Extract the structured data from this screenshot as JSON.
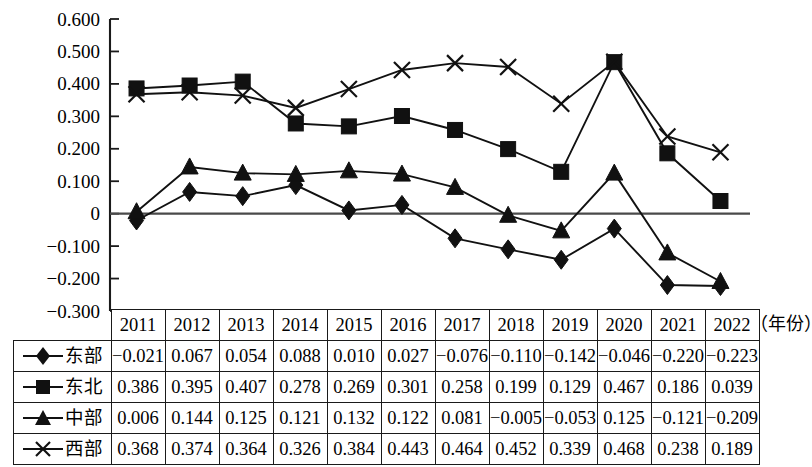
{
  "chart_data": {
    "type": "line",
    "title": "",
    "xlabel": "（年份）",
    "ylabel": "",
    "categories": [
      "2011",
      "2012",
      "2013",
      "2014",
      "2015",
      "2016",
      "2017",
      "2018",
      "2019",
      "2020",
      "2021",
      "2022"
    ],
    "ylim": [
      -0.3,
      0.6
    ],
    "ytick_labels": [
      "0.600",
      "0.500",
      "0.400",
      "0.300",
      "0.200",
      "0.100",
      "0",
      "−0.100",
      "−0.200",
      "−0.300"
    ],
    "ytick_values": [
      0.6,
      0.5,
      0.4,
      0.3,
      0.2,
      0.1,
      0,
      -0.1,
      -0.2,
      -0.3
    ],
    "grid": false,
    "legend_position": "table-row-headers",
    "zero_line": true,
    "series": [
      {
        "name": "东部",
        "marker": "diamond",
        "values": [
          -0.021,
          0.067,
          0.054,
          0.088,
          0.01,
          0.027,
          -0.076,
          -0.11,
          -0.142,
          -0.046,
          -0.22,
          -0.223
        ],
        "labels": [
          "−0.021",
          "0.067",
          "0.054",
          "0.088",
          "0.010",
          "0.027",
          "−0.076",
          "−0.110",
          "−0.142",
          "−0.046",
          "−0.220",
          "−0.223"
        ]
      },
      {
        "name": "东北",
        "marker": "square",
        "values": [
          0.386,
          0.395,
          0.407,
          0.278,
          0.269,
          0.301,
          0.258,
          0.199,
          0.129,
          0.467,
          0.186,
          0.039
        ],
        "labels": [
          "0.386",
          "0.395",
          "0.407",
          "0.278",
          "0.269",
          "0.301",
          "0.258",
          "0.199",
          "0.129",
          "0.467",
          "0.186",
          "0.039"
        ]
      },
      {
        "name": "中部",
        "marker": "triangle",
        "values": [
          0.006,
          0.144,
          0.125,
          0.121,
          0.132,
          0.122,
          0.081,
          -0.005,
          -0.053,
          0.125,
          -0.121,
          -0.209
        ],
        "labels": [
          "0.006",
          "0.144",
          "0.125",
          "0.121",
          "0.132",
          "0.122",
          "0.081",
          "−0.005",
          "−0.053",
          "0.125",
          "−0.121",
          "−0.209"
        ]
      },
      {
        "name": "西部",
        "marker": "cross",
        "values": [
          0.368,
          0.374,
          0.364,
          0.326,
          0.384,
          0.443,
          0.464,
          0.452,
          0.339,
          0.468,
          0.238,
          0.189
        ],
        "labels": [
          "0.368",
          "0.374",
          "0.364",
          "0.326",
          "0.384",
          "0.443",
          "0.464",
          "0.452",
          "0.339",
          "0.468",
          "0.238",
          "0.189"
        ]
      }
    ],
    "colors": {
      "line": "#111111",
      "axis": "#1a1a1a",
      "zero_line": "#4a4a4a",
      "background": "#ffffff"
    }
  },
  "table": {
    "corner": "",
    "year_header": [
      "2011",
      "2012",
      "2013",
      "2014",
      "2015",
      "2016",
      "2017",
      "2018",
      "2019",
      "2020",
      "2021",
      "2022"
    ],
    "rows": [
      {
        "label": "东部",
        "marker": "diamond",
        "cells": [
          "−0.021",
          "0.067",
          "0.054",
          "0.088",
          "0.010",
          "0.027",
          "−0.076",
          "−0.110",
          "−0.142",
          "−0.046",
          "−0.220",
          "−0.223"
        ]
      },
      {
        "label": "东北",
        "marker": "square",
        "cells": [
          "0.386",
          "0.395",
          "0.407",
          "0.278",
          "0.269",
          "0.301",
          "0.258",
          "0.199",
          "0.129",
          "0.467",
          "0.186",
          "0.039"
        ]
      },
      {
        "label": "中部",
        "marker": "triangle",
        "cells": [
          "0.006",
          "0.144",
          "0.125",
          "0.121",
          "0.132",
          "0.122",
          "0.081",
          "−0.005",
          "−0.053",
          "0.125",
          "−0.121",
          "−0.209"
        ]
      },
      {
        "label": "西部",
        "marker": "cross",
        "cells": [
          "0.368",
          "0.374",
          "0.364",
          "0.326",
          "0.384",
          "0.443",
          "0.464",
          "0.452",
          "0.339",
          "0.468",
          "0.238",
          "0.189"
        ]
      }
    ]
  },
  "axis_note": "（年份）"
}
